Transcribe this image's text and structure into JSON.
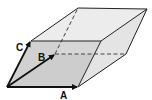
{
  "diagram": {
    "vectors": [
      {
        "label": "A",
        "from": [
          7,
          87
        ],
        "to": [
          78,
          87
        ]
      },
      {
        "label": "B",
        "from": [
          7,
          87
        ],
        "to": [
          55,
          54
        ]
      },
      {
        "label": "C",
        "from": [
          7,
          87
        ],
        "to": [
          31,
          41
        ]
      }
    ],
    "vertices": {
      "O": [
        7,
        87
      ],
      "A": [
        78,
        87
      ],
      "B": [
        55,
        54
      ],
      "C": [
        31,
        41
      ],
      "AB": [
        126,
        54
      ],
      "AC": [
        101,
        41
      ],
      "BC": [
        78,
        8
      ],
      "ABC": [
        147,
        9
      ]
    },
    "labels": {
      "A": "A",
      "B": "B",
      "C": "C"
    },
    "colors": {
      "edge": "#222222",
      "top_face": "#ececec",
      "front_face": "#c9c9c9",
      "right_face": "#e2e2e2",
      "left_face": "#dcdcdc",
      "hidden_edge": "#444444"
    }
  }
}
